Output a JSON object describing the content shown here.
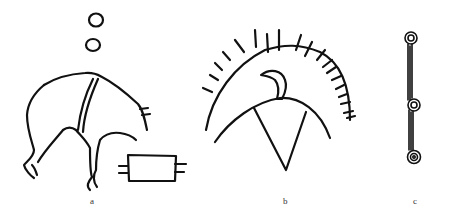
{
  "figure": {
    "panels": [
      {
        "label": "a",
        "content": "animal figure with two circles above and a rectangle with side strokes"
      },
      {
        "label": "b",
        "content": "arc with radiating ticks over a bird-like figure on a dome with a triangle"
      },
      {
        "label": "c",
        "content": "vertical line with three spiral circles"
      }
    ]
  },
  "colors": {
    "ink": "#111111",
    "background": "#ffffff"
  }
}
